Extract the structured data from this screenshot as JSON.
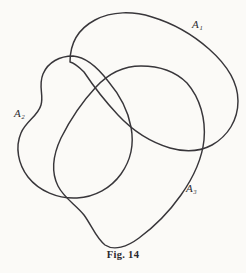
{
  "figure": {
    "caption": "Fig. 14",
    "ink_color": "#38363a",
    "background_color": "#fbfaf7",
    "labels": [
      {
        "id": "a1",
        "base": "A",
        "subscript": "1",
        "text": "A₁"
      },
      {
        "id": "a2",
        "base": "A",
        "subscript": "2",
        "text": "A₂"
      },
      {
        "id": "a3",
        "base": "A",
        "subscript": "3",
        "text": "A₃"
      }
    ],
    "curves": [
      {
        "name": "A1",
        "description": "large closed curve occupying the upper right, crossing the other two",
        "path": "M 68 56 C 72 38 88 22 110 15 C 134 8 160 14 182 26 C 206 39 228 58 236 84 C 243 107 236 128 220 142 C 206 154 188 156 172 150 C 156 145 142 134 134 120"
      },
      {
        "name": "A2",
        "description": "closed curve on the left with a wavy notched left edge",
        "path": "M 68 56 C 56 62 46 72 42 86 C 38 99 44 106 40 118 C 36 131 24 138 20 152 C 15 168 24 184 40 192 C 56 200 74 199 88 196"
      },
      {
        "name": "A3",
        "description": "closed curve sweeping from the centre right down to the bottom",
        "path": "M 134 120 C 148 112 162 100 166 86 C 170 72 160 64 146 64 C 130 64 114 72 104 84 C 94 96 88 110 88 124"
      }
    ]
  }
}
